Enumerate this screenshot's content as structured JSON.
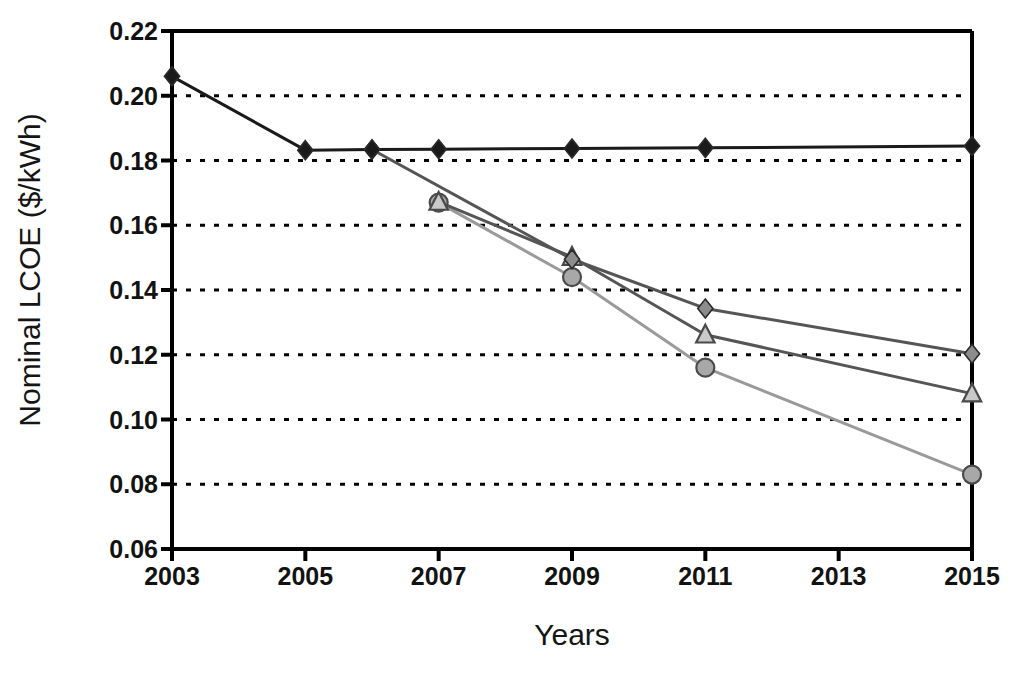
{
  "chart_data": {
    "type": "line",
    "title": "",
    "xlabel": "Years",
    "ylabel": "Nominal LCOE ($/kWh)",
    "xlim": [
      2003,
      2015
    ],
    "ylim": [
      0.06,
      0.22
    ],
    "grid": "horizontal-dotted",
    "legend": "none",
    "x_ticks": [
      2003,
      2005,
      2007,
      2009,
      2011,
      2013,
      2015
    ],
    "x_tick_labels": [
      "2003",
      "2005",
      "2007",
      "2009",
      "2011",
      "2013",
      "2015"
    ],
    "y_ticks": [
      0.06,
      0.08,
      0.1,
      0.12,
      0.14,
      0.16,
      0.18,
      0.2,
      0.22
    ],
    "y_tick_labels": [
      "0.06",
      "0.08",
      "0.10",
      "0.12",
      "0.14",
      "0.16",
      "0.18",
      "0.20",
      "0.22"
    ],
    "series": [
      {
        "name": "black-diamond-series",
        "marker": "diamond",
        "color": "#1a1a1a",
        "line_color": "#1a1a1a",
        "x": [
          2003,
          2005,
          2006,
          2007,
          2009,
          2011,
          2015
        ],
        "values": [
          0.206,
          0.1832,
          0.1834,
          0.1835,
          0.1837,
          0.1839,
          0.1845
        ]
      },
      {
        "name": "gray-diamond-series",
        "marker": "diamond",
        "color": "#8c8c8c",
        "line_color": "#555555",
        "x": [
          2006,
          2009,
          2011,
          2015
        ],
        "values": [
          0.1834,
          0.1495,
          0.1343,
          0.1203
        ]
      },
      {
        "name": "gray-triangle-series",
        "marker": "triangle",
        "color": "#c9c9c9",
        "line_color": "#555555",
        "x": [
          2007,
          2009,
          2011,
          2015
        ],
        "values": [
          0.1672,
          0.1502,
          0.1262,
          0.108
        ]
      },
      {
        "name": "gray-circle-series",
        "marker": "circle",
        "color": "#a8a8a8",
        "line_color": "#9a9a9a",
        "x": [
          2007,
          2009,
          2011,
          2015
        ],
        "values": [
          0.167,
          0.144,
          0.116,
          0.083
        ]
      }
    ]
  }
}
